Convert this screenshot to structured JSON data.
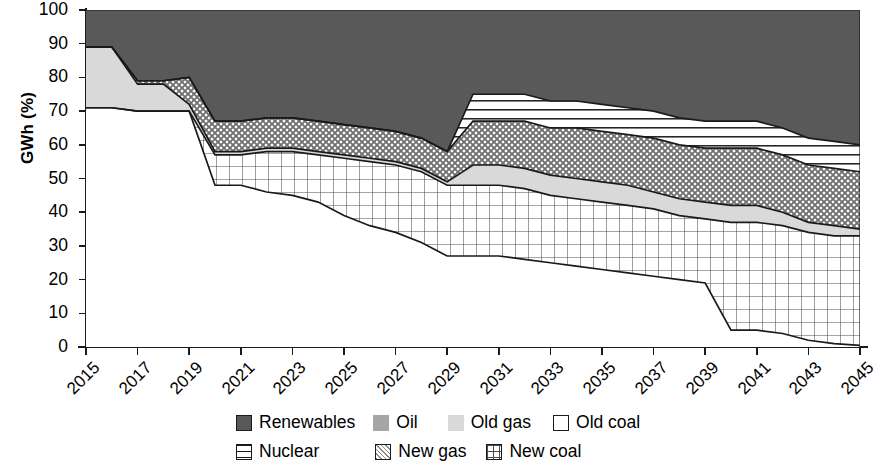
{
  "chart_data": {
    "type": "area",
    "stacked": true,
    "title": "",
    "xlabel": "",
    "ylabel": "GWh (%)",
    "ylim": [
      0,
      100
    ],
    "ytick_step": 10,
    "yticks": [
      0,
      10,
      20,
      30,
      40,
      50,
      60,
      70,
      80,
      90,
      100
    ],
    "xlim": [
      2015,
      2045
    ],
    "xticks": [
      2015,
      2017,
      2019,
      2021,
      2023,
      2025,
      2027,
      2029,
      2031,
      2033,
      2035,
      2037,
      2039,
      2041,
      2043,
      2045
    ],
    "xtick_labels": [
      "2015",
      "2017",
      "2019",
      "2021",
      "2023",
      "2025",
      "2027",
      "2029",
      "2031",
      "2033",
      "2035",
      "2037",
      "2039",
      "2041",
      "2043",
      "2045"
    ],
    "x": [
      2015,
      2016,
      2017,
      2018,
      2019,
      2020,
      2021,
      2022,
      2023,
      2024,
      2025,
      2026,
      2027,
      2028,
      2029,
      2030,
      2031,
      2032,
      2033,
      2034,
      2035,
      2036,
      2037,
      2038,
      2039,
      2040,
      2041,
      2042,
      2043,
      2044,
      2045
    ],
    "grid": false,
    "legend_position": "bottom",
    "stack_order_bottom_to_top": [
      "Old coal",
      "New coal",
      "Old gas",
      "Oil",
      "New gas",
      "Nuclear",
      "Renewables"
    ],
    "series": [
      {
        "name": "Old coal",
        "fill": "white",
        "hatch": "none",
        "values": [
          71,
          71,
          70,
          70,
          70,
          48,
          48,
          46,
          45,
          43,
          39,
          36,
          34,
          31,
          27,
          27,
          27,
          26,
          25,
          24,
          23,
          22,
          21,
          20,
          19,
          5,
          5,
          4,
          2,
          1,
          0.5
        ]
      },
      {
        "name": "New coal",
        "fill": "white",
        "hatch": "grid",
        "values": [
          0,
          0,
          0,
          0,
          0,
          9,
          9,
          12,
          13,
          14,
          17,
          19,
          20,
          21,
          21,
          21,
          21,
          21,
          20,
          20,
          20,
          20,
          20,
          19,
          19,
          32,
          32,
          32,
          32,
          32,
          32.5
        ]
      },
      {
        "name": "Old gas",
        "fill": "#d9d9d9",
        "hatch": "none",
        "values": [
          18,
          18,
          8,
          8,
          2,
          1,
          1,
          1,
          1,
          1,
          1,
          1,
          1,
          1,
          1,
          6,
          6,
          6,
          6,
          6,
          6,
          6,
          5,
          5,
          5,
          5,
          5,
          4,
          3,
          3,
          2
        ]
      },
      {
        "name": "Oil",
        "fill": "#a6a6a6",
        "hatch": "none",
        "values": [
          0,
          0,
          0,
          0,
          0,
          0,
          0,
          0,
          0,
          0,
          0,
          0,
          0,
          0,
          0,
          0,
          0,
          0,
          0,
          0,
          0,
          0,
          0,
          0,
          0,
          0,
          0,
          0,
          0,
          0,
          0
        ]
      },
      {
        "name": "New gas",
        "fill": "#d9d9d9",
        "hatch": "crosshatch",
        "values": [
          0,
          0,
          1,
          1,
          8,
          9,
          9,
          9,
          9,
          9,
          9,
          9,
          9,
          9,
          9,
          13,
          13,
          14,
          14,
          15,
          15,
          15,
          16,
          16,
          16,
          17,
          17,
          17,
          17,
          17,
          17
        ]
      },
      {
        "name": "Nuclear",
        "fill": "white",
        "hatch": "horizontal",
        "values": [
          0,
          0,
          0,
          0,
          0,
          0,
          0,
          0,
          0,
          0,
          0,
          0,
          0,
          0,
          0,
          8,
          8,
          8,
          8,
          8,
          8,
          8,
          8,
          8,
          8,
          8,
          8,
          8,
          8,
          8,
          8
        ]
      },
      {
        "name": "Renewables",
        "fill": "#595959",
        "hatch": "none",
        "values": [
          11,
          11,
          21,
          21,
          20,
          33,
          33,
          32,
          32,
          33,
          34,
          35,
          36,
          38,
          42,
          25,
          25,
          25,
          27,
          27,
          28,
          29,
          30,
          32,
          33,
          33,
          33,
          35,
          38,
          39,
          40
        ]
      }
    ],
    "boundaries_cumulative": {
      "old_coal_top": [
        71,
        71,
        70,
        70,
        70,
        48,
        48,
        46,
        45,
        43,
        39,
        36,
        34,
        31,
        27,
        27,
        27,
        26,
        25,
        24,
        23,
        22,
        21,
        20,
        19,
        5,
        5,
        4,
        2,
        1,
        0.5
      ],
      "new_coal_top": [
        71,
        71,
        70,
        70,
        70,
        57,
        57,
        58,
        58,
        57,
        56,
        55,
        54,
        52,
        48,
        48,
        48,
        47,
        45,
        44,
        43,
        42,
        41,
        39,
        38,
        37,
        37,
        36,
        34,
        33,
        33
      ],
      "old_gas_top": [
        89,
        89,
        78,
        78,
        72,
        58,
        58,
        59,
        59,
        58,
        57,
        56,
        55,
        53,
        49,
        54,
        54,
        53,
        51,
        50,
        49,
        48,
        46,
        44,
        43,
        42,
        42,
        40,
        37,
        36,
        35
      ],
      "new_gas_top": [
        89,
        89,
        79,
        79,
        80,
        67,
        67,
        68,
        68,
        67,
        66,
        65,
        64,
        62,
        58,
        67,
        67,
        67,
        65,
        65,
        64,
        63,
        62,
        60,
        59,
        59,
        59,
        57,
        54,
        53,
        52
      ],
      "nuclear_top": [
        89,
        89,
        79,
        79,
        80,
        67,
        67,
        68,
        68,
        67,
        66,
        65,
        64,
        62,
        58,
        75,
        75,
        75,
        73,
        73,
        72,
        71,
        70,
        68,
        67,
        67,
        67,
        65,
        62,
        61,
        60
      ],
      "renewables_top": [
        100,
        100,
        100,
        100,
        100,
        100,
        100,
        100,
        100,
        100,
        100,
        100,
        100,
        100,
        100,
        100,
        100,
        100,
        100,
        100,
        100,
        100,
        100,
        100,
        100,
        100,
        100,
        100,
        100,
        100,
        100
      ]
    }
  },
  "axes": {
    "y_title": "GWh (%)",
    "y_labels": [
      "100",
      "90",
      "80",
      "70",
      "60",
      "50",
      "40",
      "30",
      "20",
      "10",
      "0"
    ]
  },
  "legend": {
    "row1": [
      {
        "label": "Renewables",
        "key": "renewables",
        "swatch": "solid-dark-gray"
      },
      {
        "label": "Oil",
        "key": "oil",
        "swatch": "solid-mid-gray"
      },
      {
        "label": "Old gas",
        "key": "old-gas",
        "swatch": "solid-light-gray"
      },
      {
        "label": "Old coal",
        "key": "old-coal",
        "swatch": "empty-white"
      }
    ],
    "row2": [
      {
        "label": "Nuclear",
        "key": "nuclear",
        "swatch": "horizontal-lines"
      },
      {
        "label": "New gas",
        "key": "new-gas",
        "swatch": "diagonal-crosshatch"
      },
      {
        "label": "New coal",
        "key": "new-coal",
        "swatch": "square-grid"
      }
    ]
  },
  "colors": {
    "renewables": "#595959",
    "oil": "#a6a6a6",
    "old_gas": "#d9d9d9",
    "old_coal": "#ffffff",
    "line": "#1a1a1a"
  }
}
